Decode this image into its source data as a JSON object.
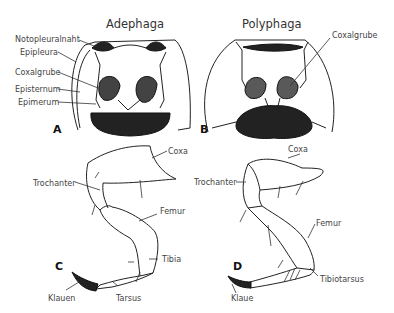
{
  "titles": {
    "left": "Adephaga",
    "right": "Polyphaga"
  },
  "panels": {
    "a": "A",
    "b": "B",
    "c": "C",
    "d": "D"
  },
  "labels_a": {
    "notopleuralnaht": "Notopleuralnaht",
    "epipleura": "Epipleura",
    "coxalgrube": "Coxalgrube",
    "episternum": "Episternum",
    "epimerum": "Epimerum"
  },
  "labels_b": {
    "coxalgrube": "Coxalgrube"
  },
  "labels_c": {
    "coxa": "Coxa",
    "trochanter": "Trochanter",
    "femur": "Femur",
    "tibia": "Tibia",
    "klauen": "Klauen",
    "tarsus": "Tarsus"
  },
  "labels_d": {
    "coxa": "Coxa",
    "trochanter": "Trochanter",
    "femur": "Femur",
    "tibiotarsus": "Tibiotarsus",
    "klaue": "Klaue"
  }
}
